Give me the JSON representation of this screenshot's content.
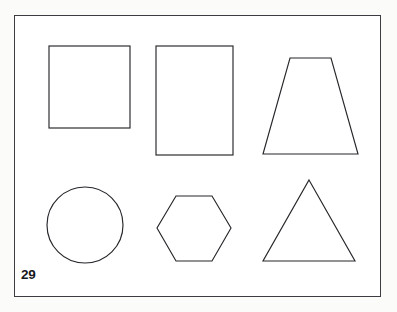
{
  "page": {
    "number_label": "29",
    "background_color": "#fbfbfa",
    "paper_color": "#ffffff",
    "frame_color": "#3c3c42",
    "stroke_color": "#26262b",
    "width": 397,
    "height": 312
  },
  "frame": {
    "x": 14,
    "y": 15,
    "width": 367,
    "height": 282
  },
  "shapes": [
    {
      "id": "square",
      "name": "square",
      "row": 1,
      "column": 1,
      "sides": 4,
      "geometry_type": "rect",
      "x": 49,
      "y": 46,
      "width": 81,
      "height": 82
    },
    {
      "id": "rectangle",
      "name": "rectangle",
      "row": 1,
      "column": 2,
      "sides": 4,
      "geometry_type": "rect",
      "x": 156,
      "y": 46,
      "width": 77,
      "height": 109
    },
    {
      "id": "trapezoid",
      "name": "trapezoid",
      "row": 1,
      "column": 3,
      "sides": 4,
      "geometry_type": "polygon",
      "points": "290,58 331,58 358,154 263,154"
    },
    {
      "id": "circle",
      "name": "circle",
      "row": 2,
      "column": 1,
      "sides": 0,
      "geometry_type": "ellipse",
      "cx": 85,
      "cy": 225,
      "rx": 38,
      "ry": 38
    },
    {
      "id": "hexagon",
      "name": "hexagon",
      "row": 2,
      "column": 2,
      "sides": 6,
      "geometry_type": "polygon",
      "points": "176,196 212,196 231,228 212,261 176,261 157,228"
    },
    {
      "id": "triangle",
      "name": "triangle",
      "row": 2,
      "column": 3,
      "sides": 3,
      "geometry_type": "polygon",
      "points": "309,180 355,261 263,261"
    }
  ]
}
